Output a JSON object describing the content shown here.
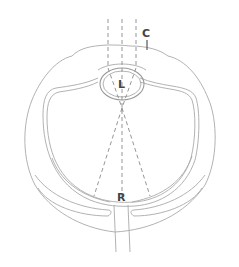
{
  "diagram": {
    "type": "eye-cross-section",
    "labels": {
      "cornea": "C",
      "lens": "L",
      "retina": "R"
    },
    "colors": {
      "line": "#a9a9a9",
      "dash": "#8a8a8a",
      "label": "#444444",
      "background": "#ffffff"
    }
  }
}
